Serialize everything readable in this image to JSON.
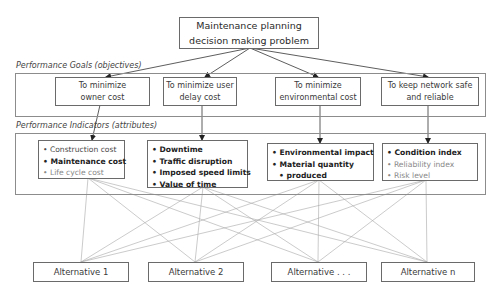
{
  "title": {
    "line1": "Maintenance planning",
    "line2": "decision making problem"
  },
  "sections": {
    "goals_label": "Performance Goals (objectives)",
    "indicators_label": "Performance Indicators (attributes)"
  },
  "goals": [
    {
      "line1": "To minimize",
      "line2": "owner cost"
    },
    {
      "line1": "To minimize user",
      "line2": "delay cost"
    },
    {
      "line1": "To minimize",
      "line2": "environmental cost"
    },
    {
      "line1": "To keep network safe",
      "line2": "and reliable"
    }
  ],
  "indicators": [
    {
      "items": [
        {
          "text": "Construction cost",
          "style": "normal"
        },
        {
          "text": "Maintenance cost",
          "style": "bold"
        },
        {
          "text": "Life cycle cost",
          "style": "light"
        }
      ]
    },
    {
      "items": [
        {
          "text": "Downtime",
          "style": "bold"
        },
        {
          "text": "Traffic disruption",
          "style": "bold"
        },
        {
          "text": "Imposed speed limits",
          "style": "bold"
        },
        {
          "text": "Value of time",
          "style": "bold"
        }
      ]
    },
    {
      "items": [
        {
          "text": "Environmental impact",
          "style": "bold"
        },
        {
          "text": "Material quantity",
          "style": "bold"
        },
        {
          "text": "produced",
          "style": "bold-cont"
        }
      ]
    },
    {
      "items": [
        {
          "text": "Condition index",
          "style": "bold"
        },
        {
          "text": "Reliability index",
          "style": "light"
        },
        {
          "text": "Risk level",
          "style": "light"
        }
      ]
    }
  ],
  "alternatives": [
    {
      "label": "Alternative 1"
    },
    {
      "label": "Alternative 2"
    },
    {
      "label": "Alternative . . ."
    },
    {
      "label": "Alternative n"
    }
  ],
  "colors": {
    "box_border": "#6a6a6a",
    "outer_border": "#8c8c8c",
    "arrow": "#333333",
    "connector": "#a8a8a8"
  }
}
